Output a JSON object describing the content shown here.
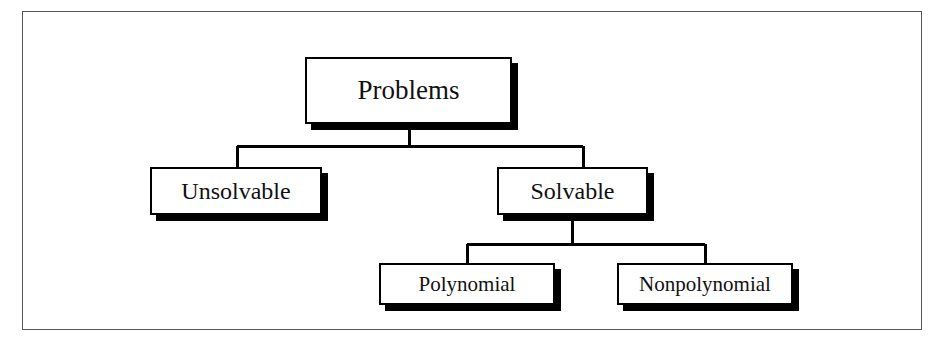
{
  "figure": {
    "background_color": "#ffffff",
    "frame_color": "#555555",
    "line_color": "#000000",
    "box_fill": "#ffffff",
    "box_border_color": "#000000",
    "shadow_color": "#000000",
    "text_color": "#111111"
  },
  "diagram": {
    "type": "tree",
    "root": "problems",
    "nodes": {
      "problems": {
        "label": "Problems"
      },
      "unsolvable": {
        "label": "Unsolvable"
      },
      "solvable": {
        "label": "Solvable"
      },
      "polynomial": {
        "label": "Polynomial"
      },
      "nonpolynomial": {
        "label": "Nonpolynomial"
      }
    },
    "edges": [
      {
        "from": "problems",
        "to": "unsolvable"
      },
      {
        "from": "problems",
        "to": "solvable"
      },
      {
        "from": "solvable",
        "to": "polynomial"
      },
      {
        "from": "solvable",
        "to": "nonpolynomial"
      }
    ]
  }
}
